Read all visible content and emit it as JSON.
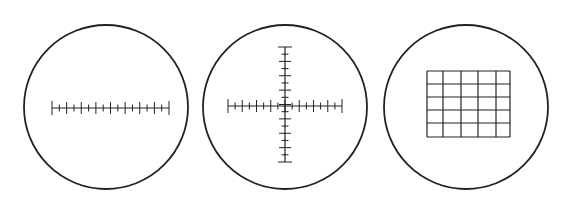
{
  "figure": {
    "stroke_color": "#222222",
    "background": "#ffffff",
    "reticles": [
      {
        "type": "linear-scale",
        "circle": {
          "cx": 106,
          "cy": 107,
          "r": 82
        },
        "scale": {
          "orientation": "horizontal",
          "x1": 52,
          "x2": 169,
          "y": 108,
          "ticks": 17,
          "major_every": 2
        }
      },
      {
        "type": "cross-scale",
        "circle": {
          "cx": 285,
          "cy": 107,
          "r": 82
        },
        "horizontal": {
          "x1": 228,
          "x2": 342,
          "y": 106,
          "ticks": 17
        },
        "vertical": {
          "y1": 47,
          "y2": 162,
          "x": 285,
          "ticks": 17
        }
      },
      {
        "type": "grid",
        "circle": {
          "cx": 466,
          "cy": 107,
          "r": 82
        },
        "grid": {
          "columns_x": [
            427,
            443,
            461,
            478,
            496,
            510
          ],
          "rows_y": [
            71,
            84,
            97,
            110,
            123,
            137
          ],
          "cols": 5,
          "rows": 5
        }
      }
    ]
  }
}
